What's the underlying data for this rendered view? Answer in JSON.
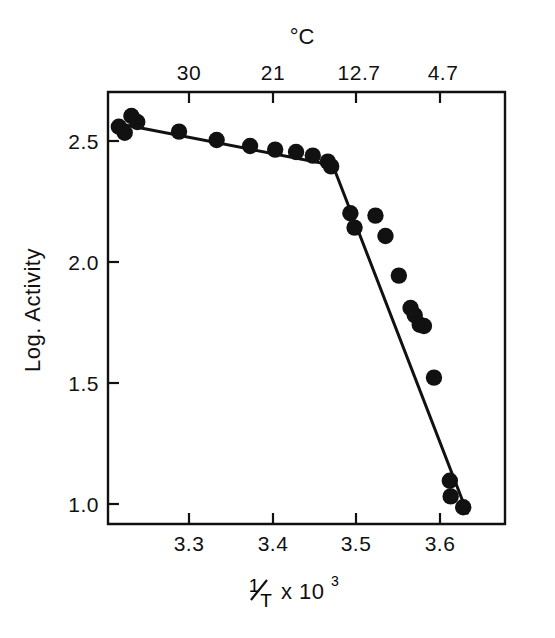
{
  "chart_data": {
    "type": "scatter",
    "title": "",
    "xlabel": "1/T x 10³",
    "ylabel": "Log. Activity",
    "top_axis_label": "°C",
    "xlim": [
      3.205,
      3.68
    ],
    "ylim": [
      0.93,
      2.73
    ],
    "grid": false,
    "legend": null,
    "x_ticks": [
      3.3,
      3.4,
      3.5,
      3.6
    ],
    "x_tick_labels": [
      "3.3",
      "3.4",
      "3.5",
      "3.6"
    ],
    "y_ticks": [
      1.0,
      1.5,
      2.0,
      2.5
    ],
    "y_tick_labels": [
      "1.0",
      "1.5",
      "2.0",
      "2.5"
    ],
    "top_ticks_x": [
      3.3,
      3.4,
      3.5,
      3.6
    ],
    "top_tick_labels": [
      "30",
      "21",
      "12.7",
      "4.7"
    ],
    "points": [
      {
        "x": 3.218,
        "y": 2.585
      },
      {
        "x": 3.225,
        "y": 2.56
      },
      {
        "x": 3.233,
        "y": 2.63
      },
      {
        "x": 3.24,
        "y": 2.605
      },
      {
        "x": 3.29,
        "y": 2.565
      },
      {
        "x": 3.335,
        "y": 2.53
      },
      {
        "x": 3.375,
        "y": 2.505
      },
      {
        "x": 3.405,
        "y": 2.49
      },
      {
        "x": 3.43,
        "y": 2.48
      },
      {
        "x": 3.45,
        "y": 2.465
      },
      {
        "x": 3.468,
        "y": 2.44
      },
      {
        "x": 3.472,
        "y": 2.42
      },
      {
        "x": 3.495,
        "y": 2.225
      },
      {
        "x": 3.5,
        "y": 2.165
      },
      {
        "x": 3.525,
        "y": 2.215
      },
      {
        "x": 3.537,
        "y": 2.13
      },
      {
        "x": 3.553,
        "y": 1.965
      },
      {
        "x": 3.567,
        "y": 1.83
      },
      {
        "x": 3.572,
        "y": 1.8
      },
      {
        "x": 3.578,
        "y": 1.76
      },
      {
        "x": 3.583,
        "y": 1.755
      },
      {
        "x": 3.595,
        "y": 1.54
      },
      {
        "x": 3.614,
        "y": 1.11
      },
      {
        "x": 3.615,
        "y": 1.045
      },
      {
        "x": 3.63,
        "y": 1.0
      }
    ],
    "fit_lines": [
      {
        "name": "upper-segment",
        "x_start": 3.215,
        "y_start": 2.6,
        "x_end": 3.474,
        "y_end": 2.425
      },
      {
        "name": "lower-segment",
        "x_start": 3.474,
        "y_start": 2.425,
        "x_end": 3.635,
        "y_end": 0.975
      }
    ],
    "break_point": {
      "x": 3.474,
      "y": 2.425
    }
  },
  "axes": {
    "y_axis_title": "Log. Activity",
    "x_axis_title_numerator": "1",
    "x_axis_title_denominator": "T",
    "x_axis_title_rest": "x 10",
    "x_axis_title_exponent": "3",
    "top_axis_title": "°C"
  }
}
